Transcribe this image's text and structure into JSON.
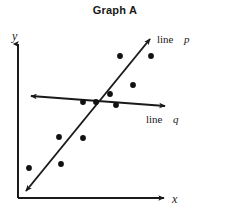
{
  "title": "Graph A",
  "axes": {
    "y_label": "y",
    "x_label": "x"
  },
  "labels": {
    "line_p_prefix": "line",
    "line_p_name": "p",
    "line_q_prefix": "line",
    "line_q_name": "q"
  },
  "colors": {
    "ink": "#1a1a1a",
    "background": "#ffffff",
    "point": "#111111"
  },
  "chart_data": {
    "type": "scatter",
    "title": "Graph A",
    "xlabel": "x",
    "ylabel": "y",
    "grid": false,
    "legend": "inline-annotations",
    "axis_style": "arrow-headed quadrant-one axes, no tick marks, no numeric scale",
    "points_px": [
      {
        "x": 29,
        "y": 168
      },
      {
        "x": 59,
        "y": 137
      },
      {
        "x": 83,
        "y": 138
      },
      {
        "x": 61,
        "y": 164
      },
      {
        "x": 83,
        "y": 102
      },
      {
        "x": 96,
        "y": 102
      },
      {
        "x": 110,
        "y": 94
      },
      {
        "x": 116,
        "y": 105
      },
      {
        "x": 120,
        "y": 56
      },
      {
        "x": 133,
        "y": 85
      },
      {
        "x": 151,
        "y": 56
      }
    ],
    "lines": [
      {
        "name": "line p",
        "label": "p",
        "slope_sign": "positive",
        "description": "steep positive-slope line of best fit through the scatter, double arrowheaded",
        "from_px": {
          "x": 24,
          "y": 193
        },
        "to_px": {
          "x": 152,
          "y": 36
        }
      },
      {
        "name": "line q",
        "label": "q",
        "slope_sign": "slightly negative",
        "description": "nearly horizontal line, double arrowheaded",
        "from_px": {
          "x": 29,
          "y": 96
        },
        "to_px": {
          "x": 167,
          "y": 106
        }
      }
    ]
  }
}
